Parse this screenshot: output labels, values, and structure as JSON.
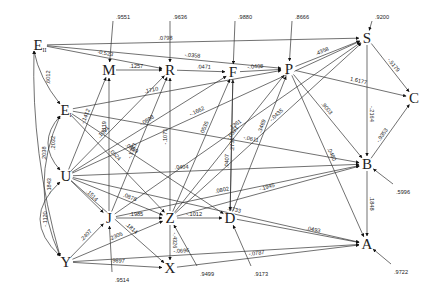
{
  "diagram": {
    "type": "path-diagram",
    "nodes": [
      {
        "id": "E_II",
        "label": "E",
        "sub": "II",
        "x": 40,
        "y": 45
      },
      {
        "id": "E_I",
        "label": "E",
        "sub": "I",
        "x": 66,
        "y": 110
      },
      {
        "id": "M",
        "label": "M",
        "x": 109,
        "y": 70
      },
      {
        "id": "R",
        "label": "R",
        "x": 170,
        "y": 70
      },
      {
        "id": "F",
        "label": "F",
        "x": 233,
        "y": 72
      },
      {
        "id": "P",
        "label": "P",
        "x": 289,
        "y": 69
      },
      {
        "id": "S",
        "label": "S",
        "x": 367,
        "y": 38
      },
      {
        "id": "C",
        "label": "C",
        "x": 414,
        "y": 98
      },
      {
        "id": "U",
        "label": "U",
        "x": 66,
        "y": 176
      },
      {
        "id": "J",
        "label": "J",
        "x": 109,
        "y": 218
      },
      {
        "id": "Z",
        "label": "Z",
        "x": 170,
        "y": 218
      },
      {
        "id": "D",
        "label": "D",
        "x": 230,
        "y": 218
      },
      {
        "id": "B",
        "label": "B",
        "x": 367,
        "y": 164
      },
      {
        "id": "A",
        "label": "A",
        "x": 367,
        "y": 244
      },
      {
        "id": "X",
        "label": "X",
        "x": 170,
        "y": 268
      },
      {
        "id": "Y",
        "label": "Y",
        "x": 66,
        "y": 262
      }
    ],
    "disturbances": [
      {
        "target": "M",
        "value": ".9551",
        "x": 113,
        "y": 19
      },
      {
        "target": "R",
        "value": ".9636",
        "x": 170,
        "y": 19
      },
      {
        "target": "F",
        "value": ".9880",
        "x": 235,
        "y": 19
      },
      {
        "target": "P",
        "value": ".8666",
        "x": 292,
        "y": 19
      },
      {
        "target": "S",
        "value": ".9200",
        "x": 372,
        "y": 19
      },
      {
        "target": "B",
        "value": ".5996",
        "x": 393,
        "y": 190
      },
      {
        "target": "A",
        "value": ".9722",
        "x": 391,
        "y": 270
      },
      {
        "target": "Z",
        "value": ".9499",
        "x": 197,
        "y": 272
      },
      {
        "target": "D",
        "value": ".9173",
        "x": 251,
        "y": 272
      },
      {
        "target": "J",
        "value": ".9514",
        "x": 112,
        "y": 278
      }
    ],
    "correlations": [
      {
        "between": [
          "E_II",
          "E_I"
        ],
        "value": ".6012"
      },
      {
        "between": [
          "E_II",
          "Y"
        ],
        "value": ".2038"
      },
      {
        "between": [
          "E_I",
          "U"
        ],
        "value": ".2032"
      },
      {
        "between": [
          "E_I",
          "Y"
        ],
        "value": "-.1843"
      },
      {
        "between": [
          "U",
          "Y"
        ],
        "value": "-.1120"
      }
    ],
    "paths": [
      {
        "from": "E_II",
        "to": "S",
        "value": ".0798"
      },
      {
        "from": "M",
        "to": "R",
        "value": ".1257"
      },
      {
        "from": "E_II",
        "to": "R",
        "value": "-0.523"
      },
      {
        "from": "R",
        "to": "F",
        "value": ".0471"
      },
      {
        "from": "E_II",
        "to": "P",
        "value": "-.0358"
      },
      {
        "from": "F",
        "to": "P",
        "value": "-.0408"
      },
      {
        "from": "P",
        "to": "S",
        "value": ".4358"
      },
      {
        "from": "S",
        "to": "C",
        "value": "-.5179"
      },
      {
        "from": "P",
        "to": "C",
        "value": "1.6177"
      },
      {
        "from": "S",
        "to": "B",
        "value": "-.2164"
      },
      {
        "from": "B",
        "to": "C",
        "value": "-.9353"
      },
      {
        "from": "P",
        "to": "B",
        "value": ".9003"
      },
      {
        "from": "B",
        "to": "A",
        "value": ".1848"
      },
      {
        "from": "U",
        "to": "M",
        "value": "-.1412"
      },
      {
        "from": "J",
        "to": "M",
        "value": "-.1119"
      },
      {
        "from": "U",
        "to": "R",
        "value": ".1091"
      },
      {
        "from": "J",
        "to": "R",
        "value": "-.1383"
      },
      {
        "from": "U",
        "to": "F",
        "value": "-.0898"
      },
      {
        "from": "Z",
        "to": "R",
        "value": "-.1071"
      },
      {
        "from": "Z",
        "to": "F",
        "value": ".0535"
      },
      {
        "from": "D",
        "to": "F",
        "value": ".0407"
      },
      {
        "from": "E_I",
        "to": "Z",
        "value": ".0524"
      },
      {
        "from": "F",
        "to": "D",
        "value": ".2735"
      },
      {
        "from": "Z",
        "to": "P",
        "value": "-.0531"
      },
      {
        "from": "D",
        "to": "P",
        "value": ".3469"
      },
      {
        "from": "E_I",
        "to": "P",
        "value": ".1710"
      },
      {
        "from": "U",
        "to": "S",
        "value": "-.1662"
      },
      {
        "from": "J",
        "to": "S",
        "value": ".1361"
      },
      {
        "from": "Z",
        "to": "S",
        "value": "-.0435"
      },
      {
        "from": "E_I",
        "to": "B",
        "value": "-.0611"
      },
      {
        "from": "U",
        "to": "B",
        "value": ".0404"
      },
      {
        "from": "J",
        "to": "B",
        "value": ".0802"
      },
      {
        "from": "Z",
        "to": "B",
        "value": "-.1945"
      },
      {
        "from": "U",
        "to": "J",
        "value": ".1514"
      },
      {
        "from": "U",
        "to": "Z",
        "value": ".0878"
      },
      {
        "from": "E_I",
        "to": "D",
        "value": ".0959"
      },
      {
        "from": "J",
        "to": "Z",
        "value": ".1985"
      },
      {
        "from": "Y",
        "to": "Z",
        "value": ".2305"
      },
      {
        "from": "Y",
        "to": "J",
        "value": ".2407"
      },
      {
        "from": "U",
        "to": "X",
        "value": ".1814"
      },
      {
        "from": "Z",
        "to": "D",
        "value": "-.1012"
      },
      {
        "from": "Z",
        "to": "X",
        "value": "-.4326"
      },
      {
        "from": "Y",
        "to": "X",
        "value": ".9897"
      },
      {
        "from": "U",
        "to": "A",
        "value": ".0733"
      },
      {
        "from": "D",
        "to": "A",
        "value": ".0493"
      },
      {
        "from": "Y",
        "to": "A",
        "value": "-.0696"
      },
      {
        "from": "X",
        "to": "A",
        "value": "-.0787"
      },
      {
        "from": "P",
        "to": "A",
        "value": ".0480"
      },
      {
        "from": "U",
        "to": "Yd",
        "value": ".1196"
      }
    ]
  }
}
